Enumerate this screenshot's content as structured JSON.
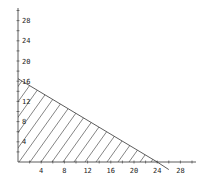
{
  "chart_data": {
    "type": "area",
    "title": "",
    "xlabel": "",
    "ylabel": "",
    "xlim": [
      0,
      30
    ],
    "ylim": [
      0,
      30
    ],
    "grid": false,
    "x_ticks": [
      4,
      8,
      12,
      16,
      20,
      24,
      28
    ],
    "y_ticks": [
      4,
      8,
      12,
      16,
      20,
      24,
      28
    ],
    "x_tick_labels": [
      "4",
      "8",
      "12",
      "16",
      "20",
      "24",
      "28"
    ],
    "y_tick_labels": [
      "4",
      "8",
      "12",
      "16",
      "20",
      "24",
      "28"
    ],
    "series": [
      {
        "name": "boundary line",
        "type": "line",
        "points": [
          [
            0,
            16.5
          ],
          [
            24,
            0
          ],
          [
            26,
            -1.5
          ]
        ]
      },
      {
        "name": "feasible region (hatched)",
        "type": "polygon",
        "fill": "diagonal-hatch",
        "points": [
          [
            0,
            0
          ],
          [
            0,
            16.5
          ],
          [
            24,
            0
          ]
        ]
      }
    ]
  },
  "colors": {
    "axis": "#333333",
    "line": "#333333",
    "hatch": "#333333",
    "background": "#ffffff"
  }
}
